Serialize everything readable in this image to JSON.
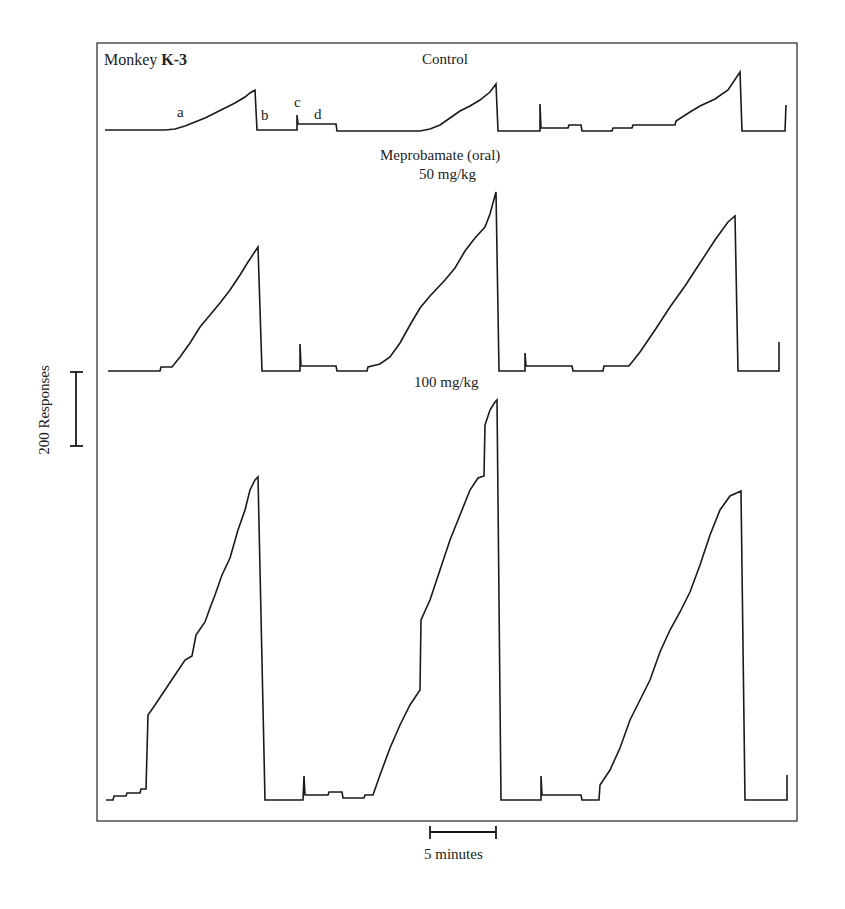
{
  "chart_data": {
    "type": "line",
    "title": "Monkey K-3",
    "subject": "Monkey K-3",
    "frame": {
      "left": 97,
      "top": 43,
      "right": 797,
      "bottom": 821
    },
    "scale_bars": {
      "y": {
        "label": "200 Responses",
        "value": 200,
        "unit": "responses",
        "y1": 372,
        "y2": 446,
        "x": 76
      },
      "x": {
        "label": "5 minutes",
        "value": 5,
        "unit": "minutes",
        "x1": 430,
        "x2": 496,
        "y": 832
      }
    },
    "segment_labels": [
      {
        "text": "a",
        "x": 180,
        "y": 112
      },
      {
        "text": "b",
        "x": 264,
        "y": 114
      },
      {
        "text": "c",
        "x": 297,
        "y": 103
      },
      {
        "text": "d",
        "x": 318,
        "y": 114
      }
    ],
    "panel_labels": [
      {
        "text": "Control",
        "x": 447,
        "y": 60
      },
      {
        "text": "Meprobamate (oral)",
        "x": 450,
        "y": 156
      },
      {
        "text": "50 mg/kg",
        "x": 450,
        "y": 176
      },
      {
        "text": "100 mg/kg",
        "x": 449,
        "y": 383
      }
    ],
    "series": [
      {
        "name": "Control",
        "baseline_y": 130,
        "peaks_responses_approx": [
          110,
          125,
          155
        ],
        "points": [
          [
            105,
            130
          ],
          [
            165,
            130
          ],
          [
            175,
            129
          ],
          [
            185,
            126
          ],
          [
            195,
            122
          ],
          [
            205,
            118
          ],
          [
            215,
            113
          ],
          [
            225,
            108
          ],
          [
            235,
            103
          ],
          [
            245,
            97
          ],
          [
            250,
            93
          ],
          [
            255,
            90
          ],
          [
            257,
            130
          ],
          [
            297,
            130
          ],
          [
            297,
            115
          ],
          [
            298,
            124
          ],
          [
            336,
            124
          ],
          [
            337,
            131
          ],
          [
            420,
            131
          ],
          [
            430,
            129
          ],
          [
            440,
            125
          ],
          [
            450,
            118
          ],
          [
            460,
            111
          ],
          [
            470,
            106
          ],
          [
            480,
            100
          ],
          [
            490,
            92
          ],
          [
            496,
            84
          ],
          [
            498,
            131
          ],
          [
            540,
            131
          ],
          [
            540,
            104
          ],
          [
            541,
            128
          ],
          [
            568,
            128
          ],
          [
            569,
            125
          ],
          [
            581,
            125
          ],
          [
            582,
            131
          ],
          [
            612,
            131
          ],
          [
            613,
            128
          ],
          [
            632,
            128
          ],
          [
            633,
            125
          ],
          [
            675,
            125
          ],
          [
            676,
            121
          ],
          [
            690,
            112
          ],
          [
            700,
            106
          ],
          [
            715,
            99
          ],
          [
            728,
            90
          ],
          [
            740,
            72
          ],
          [
            742,
            131
          ],
          [
            785,
            131
          ],
          [
            786,
            105
          ]
        ]
      },
      {
        "name": "Meprobamate 50 mg/kg",
        "baseline_y": 371,
        "peaks_responses_approx": [
          335,
          480,
          420
        ],
        "points": [
          [
            108,
            371
          ],
          [
            160,
            371
          ],
          [
            161,
            367
          ],
          [
            172,
            367
          ],
          [
            180,
            357
          ],
          [
            190,
            343
          ],
          [
            200,
            327
          ],
          [
            210,
            315
          ],
          [
            220,
            303
          ],
          [
            230,
            290
          ],
          [
            240,
            275
          ],
          [
            248,
            262
          ],
          [
            258,
            247
          ],
          [
            262,
            371
          ],
          [
            300,
            371
          ],
          [
            300,
            344
          ],
          [
            301,
            366
          ],
          [
            336,
            366
          ],
          [
            337,
            371
          ],
          [
            367,
            371
          ],
          [
            368,
            367
          ],
          [
            380,
            364
          ],
          [
            390,
            357
          ],
          [
            400,
            343
          ],
          [
            410,
            325
          ],
          [
            420,
            308
          ],
          [
            430,
            296
          ],
          [
            445,
            280
          ],
          [
            455,
            268
          ],
          [
            465,
            251
          ],
          [
            475,
            238
          ],
          [
            485,
            227
          ],
          [
            490,
            214
          ],
          [
            496,
            192
          ],
          [
            499,
            371
          ],
          [
            525,
            371
          ],
          [
            525,
            353
          ],
          [
            526,
            366
          ],
          [
            572,
            366
          ],
          [
            573,
            371
          ],
          [
            603,
            371
          ],
          [
            604,
            366
          ],
          [
            629,
            366
          ],
          [
            640,
            352
          ],
          [
            655,
            330
          ],
          [
            670,
            307
          ],
          [
            685,
            286
          ],
          [
            700,
            263
          ],
          [
            715,
            240
          ],
          [
            728,
            222
          ],
          [
            735,
            216
          ],
          [
            738,
            371
          ],
          [
            779,
            371
          ],
          [
            779,
            342
          ]
        ]
      },
      {
        "name": "Meprobamate 100 mg/kg",
        "baseline_y": 800,
        "peaks_responses_approx": [
          870,
          1080,
          840
        ],
        "points": [
          [
            106,
            800
          ],
          [
            113,
            800
          ],
          [
            114,
            796
          ],
          [
            126,
            796
          ],
          [
            127,
            793
          ],
          [
            140,
            793
          ],
          [
            141,
            789
          ],
          [
            146,
            789
          ],
          [
            148,
            715
          ],
          [
            155,
            705
          ],
          [
            165,
            690
          ],
          [
            175,
            675
          ],
          [
            185,
            660
          ],
          [
            192,
            656
          ],
          [
            196,
            635
          ],
          [
            205,
            622
          ],
          [
            210,
            608
          ],
          [
            215,
            595
          ],
          [
            222,
            575
          ],
          [
            230,
            558
          ],
          [
            238,
            530
          ],
          [
            245,
            510
          ],
          [
            250,
            490
          ],
          [
            255,
            480
          ],
          [
            258,
            477
          ],
          [
            265,
            800
          ],
          [
            303,
            800
          ],
          [
            304,
            776
          ],
          [
            305,
            795
          ],
          [
            328,
            795
          ],
          [
            329,
            792
          ],
          [
            342,
            792
          ],
          [
            343,
            798
          ],
          [
            364,
            798
          ],
          [
            365,
            795
          ],
          [
            373,
            795
          ],
          [
            380,
            775
          ],
          [
            390,
            748
          ],
          [
            400,
            725
          ],
          [
            410,
            705
          ],
          [
            420,
            690
          ],
          [
            421,
            620
          ],
          [
            430,
            600
          ],
          [
            440,
            570
          ],
          [
            450,
            540
          ],
          [
            460,
            515
          ],
          [
            470,
            490
          ],
          [
            478,
            478
          ],
          [
            484,
            476
          ],
          [
            485,
            425
          ],
          [
            490,
            410
          ],
          [
            495,
            402
          ],
          [
            497,
            400
          ],
          [
            501,
            800
          ],
          [
            541,
            800
          ],
          [
            541,
            776
          ],
          [
            542,
            795
          ],
          [
            581,
            795
          ],
          [
            582,
            800
          ],
          [
            599,
            800
          ],
          [
            600,
            785
          ],
          [
            610,
            770
          ],
          [
            620,
            748
          ],
          [
            630,
            720
          ],
          [
            640,
            700
          ],
          [
            650,
            680
          ],
          [
            660,
            652
          ],
          [
            670,
            630
          ],
          [
            680,
            612
          ],
          [
            690,
            592
          ],
          [
            700,
            565
          ],
          [
            710,
            535
          ],
          [
            720,
            510
          ],
          [
            730,
            496
          ],
          [
            741,
            491
          ],
          [
            745,
            800
          ],
          [
            787,
            800
          ],
          [
            787,
            775
          ]
        ]
      }
    ],
    "xlabel": "time (5-minute scale bar)",
    "ylabel": "cumulative responses (200-response scale bar)",
    "grid": false,
    "legend": null
  },
  "labels": {
    "monkey_prefix": "Monkey ",
    "monkey_id": "K-3",
    "control": "Control",
    "drug": "Meprobamate (oral)",
    "dose_50": "50 mg/kg",
    "dose_100": "100 mg/kg",
    "seg_a": "a",
    "seg_b": "b",
    "seg_c": "c",
    "seg_d": "d",
    "y_scale": "200 Responses",
    "x_scale": "5 minutes"
  },
  "colors": {
    "ink": "#1a1a1a",
    "frame": "#333333",
    "background": "#ffffff"
  }
}
